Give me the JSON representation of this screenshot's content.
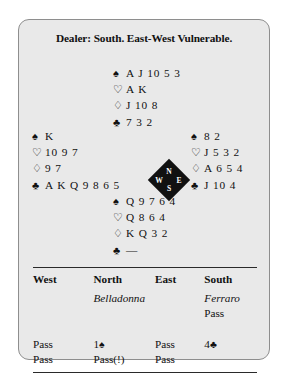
{
  "deal": {
    "title": "Dealer: South. East-West Vulnerable.",
    "suit_symbols": {
      "spade": "♠",
      "heart": "♡",
      "diamond": "♢",
      "club": "♣"
    },
    "hands": {
      "north": {
        "spades": "A J 10 5 3",
        "hearts": "A K",
        "diamonds": "J 10 8",
        "clubs": "7 3 2"
      },
      "west": {
        "spades": "K",
        "hearts": "10 9 7",
        "diamonds": "9 7",
        "clubs": "A K Q 9 8 6 5"
      },
      "east": {
        "spades": "8 2",
        "hearts": "J 5 3 2",
        "diamonds": "A 6 5 4",
        "clubs": "J 10 4"
      },
      "south": {
        "spades": "Q 9 7 6 4",
        "hearts": "Q 8 6 4",
        "diamonds": "K Q 3 2",
        "clubs": "—"
      }
    },
    "compass": {
      "north": "N",
      "south": "S",
      "east": "E",
      "west": "W"
    }
  },
  "auction": {
    "headers": {
      "west": "West",
      "north": "North",
      "east": "East",
      "south": "South"
    },
    "players": {
      "west": "",
      "north": "Belladonna",
      "east": "",
      "south": "Ferraro"
    },
    "rows": [
      {
        "west": "",
        "north": "",
        "east": "",
        "south": "Pass",
        "south_suit": ""
      },
      {
        "west": "Pass",
        "north": "1",
        "north_suit": "♠",
        "east": "Pass",
        "south": "4",
        "south_suit": "♣"
      },
      {
        "west": "Pass",
        "north": "Pass(!)",
        "north_suit": "",
        "east": "Pass",
        "south": "",
        "south_suit": ""
      }
    ]
  }
}
